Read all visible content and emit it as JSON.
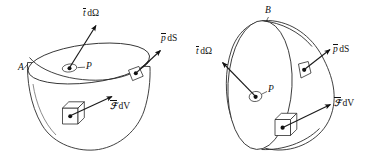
{
  "figure": {
    "stroke_color": "#2b2b2b",
    "text_color": "#111111",
    "background": "#ffffff",
    "panels": [
      {
        "id": "left-panel",
        "shape": "bowl-shaped body with elliptical top face",
        "surface_label": "A",
        "point_label": "P",
        "labels": {
          "traction": {
            "vector": "t",
            "differential": "dΩ",
            "full": "t̄ dΩ"
          },
          "surface_force": {
            "vector": "p",
            "differential": "dS",
            "full": "p̄ dS"
          },
          "body_force": {
            "vector": "ℱ",
            "differential": "dV",
            "full": "ℱ̄ dV"
          }
        }
      },
      {
        "id": "right-panel",
        "shape": "teardrop-shaped body with large elliptical left face",
        "surface_label": "B",
        "point_label": "P",
        "labels": {
          "traction": {
            "vector": "t",
            "differential": "dΩ",
            "full": "t̄ dΩ"
          },
          "surface_force": {
            "vector": "p",
            "differential": "dS",
            "full": "p̄ dS"
          },
          "body_force": {
            "vector": "ℱ",
            "differential": "dV",
            "full": "ℱ̄ dV"
          }
        }
      }
    ],
    "glyphs": {
      "t_italic": "t",
      "p_italic": "p",
      "script_f": "ℱ",
      "d_upright": "d",
      "omega_cap": "Ω",
      "S_italic": "S",
      "V_italic": "V"
    }
  }
}
